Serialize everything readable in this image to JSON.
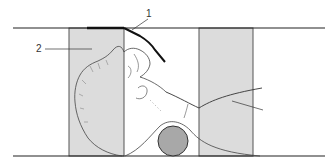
{
  "figure": {
    "labels": [
      {
        "id": "1",
        "text": "1"
      },
      {
        "id": "2",
        "text": "2"
      }
    ],
    "colors": {
      "panel_fill": "#dcdcdc",
      "panel_stroke": "#555555",
      "line": "#222222",
      "roll_fill": "#a8a8a8",
      "roll_stroke": "#333333",
      "outline": "#444444",
      "background": "#ffffff"
    }
  }
}
